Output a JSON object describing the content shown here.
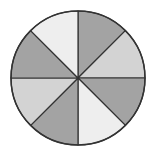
{
  "diagram": {
    "type": "fraction-circle",
    "center": [
      78,
      78
    ],
    "radius": 67,
    "sector_count": 8,
    "outline_color": "#333333",
    "fill_colors": {
      "dark": "#a3a3a3",
      "light": "#d3d3d3",
      "lightest": "#eeeeee"
    },
    "sectors": [
      {
        "index": 0,
        "start_deg": 0,
        "end_deg": 45,
        "shade": "dark"
      },
      {
        "index": 1,
        "start_deg": 45,
        "end_deg": 90,
        "shade": "light"
      },
      {
        "index": 2,
        "start_deg": 90,
        "end_deg": 135,
        "shade": "dark"
      },
      {
        "index": 3,
        "start_deg": 135,
        "end_deg": 180,
        "shade": "lightest"
      },
      {
        "index": 4,
        "start_deg": 180,
        "end_deg": 225,
        "shade": "dark"
      },
      {
        "index": 5,
        "start_deg": 225,
        "end_deg": 270,
        "shade": "light"
      },
      {
        "index": 6,
        "start_deg": 270,
        "end_deg": 315,
        "shade": "dark"
      },
      {
        "index": 7,
        "start_deg": 315,
        "end_deg": 360,
        "shade": "lightest"
      }
    ]
  }
}
